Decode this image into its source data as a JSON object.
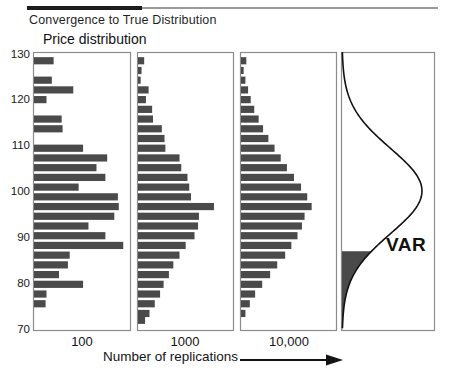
{
  "header": {
    "rule_dark_color": "#1c1c1c",
    "rule_light_color": "#9a9a9a"
  },
  "chart_data": {
    "type": "bar",
    "title": "Convergence to True Distribution",
    "ylabel": "Price distribution",
    "xlabel": "Number of replications",
    "xlabel_arrow": "⟶",
    "ylim": [
      70,
      130
    ],
    "yticks": [
      130,
      120,
      110,
      100,
      90,
      80,
      70
    ],
    "ytick_labels": [
      "130",
      "120",
      "110",
      "100",
      "90",
      "80",
      "70"
    ],
    "grid": false,
    "legend": null,
    "bar_color": "#4a4a4a",
    "frame_color": "#8c8c8c",
    "orientation": "horizontal",
    "panels": [
      {
        "caption": "100",
        "name": "histogram-100-replications",
        "bin_centers": [
          129.4,
          127.2,
          125.0,
          122.8,
          120.6,
          118.4,
          116.2,
          114.0,
          111.8,
          109.6,
          107.4,
          105.2,
          103.0,
          100.8,
          98.6,
          96.4,
          94.2,
          92.0,
          89.8,
          87.6,
          85.4,
          83.2,
          81.0,
          78.8,
          76.6,
          74.4,
          72.2
        ],
        "values": [
          0.22,
          0.0,
          0.2,
          0.44,
          0.14,
          0.0,
          0.31,
          0.32,
          0.0,
          0.55,
          0.82,
          0.7,
          0.8,
          0.5,
          0.94,
          0.95,
          0.9,
          0.61,
          0.8,
          1.0,
          0.4,
          0.38,
          0.28,
          0.55,
          0.14,
          0.13,
          0.0
        ],
        "ymax_scale": 1.0
      },
      {
        "caption": "1000",
        "name": "histogram-1000-replications",
        "bin_centers": [
          129.4,
          127.2,
          125.0,
          122.8,
          120.6,
          118.4,
          116.2,
          114.0,
          111.8,
          109.6,
          107.4,
          105.2,
          103.0,
          100.8,
          98.6,
          96.4,
          94.2,
          92.0,
          89.8,
          87.6,
          85.4,
          83.2,
          81.0,
          78.8,
          76.6,
          74.4,
          72.2
        ],
        "values": [
          0.07,
          0.04,
          0.03,
          0.12,
          0.09,
          0.16,
          0.17,
          0.27,
          0.3,
          0.31,
          0.47,
          0.49,
          0.56,
          0.58,
          0.6,
          0.86,
          0.69,
          0.68,
          0.64,
          0.54,
          0.47,
          0.4,
          0.35,
          0.29,
          0.25,
          0.19,
          0.13
        ],
        "tail_values": [
          0.08,
          0.02,
          0.05
        ],
        "ymax_scale": 1.0
      },
      {
        "caption": "10,000",
        "name": "histogram-10000-replications",
        "bin_centers": [
          129.4,
          127.2,
          125.0,
          122.8,
          120.6,
          118.4,
          116.2,
          114.0,
          111.8,
          109.6,
          107.4,
          105.2,
          103.0,
          100.8,
          98.6,
          96.4,
          94.2,
          92.0,
          89.8,
          87.6,
          85.4,
          83.2,
          81.0,
          78.8,
          76.6,
          74.4,
          72.2
        ],
        "values": [
          0.06,
          0.03,
          0.05,
          0.08,
          0.11,
          0.15,
          0.2,
          0.25,
          0.31,
          0.38,
          0.45,
          0.52,
          0.6,
          0.68,
          0.75,
          0.8,
          0.72,
          0.69,
          0.64,
          0.57,
          0.5,
          0.41,
          0.33,
          0.24,
          0.16,
          0.1,
          0.05
        ],
        "ymax_scale": 1.0
      },
      {
        "caption": "",
        "name": "true-distribution-curve",
        "curve_label": "VAR",
        "curve_type": "normal-density",
        "mean": 100.0,
        "shaded_tail_upper_bound": 87.0,
        "shaded_region_label": "VAR",
        "shade_color": "#4a4a4a"
      }
    ]
  }
}
